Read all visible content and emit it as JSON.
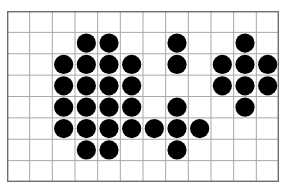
{
  "figure": {
    "kind": "dot-grid-pattern",
    "background_color": "#ffffff",
    "grid": {
      "columns": 12,
      "rows": 8,
      "cell_width": 22.67,
      "cell_height": 21.38,
      "line_color": "#a8a8a8",
      "border_color": "#6e6e6e",
      "line_width": 1,
      "border_width": 1.4,
      "origin_x": 7,
      "origin_y": 11,
      "width": 272,
      "height": 171
    },
    "dot": {
      "color": "#000000",
      "radius": 9.6,
      "count": 33
    },
    "shapes": [
      {
        "name": "left-shape",
        "label": "left-block",
        "cells": [
          [
            3,
            1
          ],
          [
            4,
            1
          ],
          [
            2,
            2
          ],
          [
            3,
            2
          ],
          [
            4,
            2
          ],
          [
            5,
            2
          ],
          [
            2,
            3
          ],
          [
            3,
            3
          ],
          [
            4,
            3
          ],
          [
            5,
            3
          ],
          [
            2,
            4
          ],
          [
            3,
            4
          ],
          [
            4,
            4
          ],
          [
            5,
            4
          ],
          [
            2,
            5
          ],
          [
            3,
            5
          ],
          [
            4,
            5
          ],
          [
            5,
            5
          ],
          [
            3,
            6
          ],
          [
            4,
            6
          ]
        ]
      },
      {
        "name": "middle-shape",
        "label": "middle-plus",
        "cells": [
          [
            7,
            1
          ],
          [
            7,
            2
          ],
          [
            7,
            4
          ],
          [
            6,
            5
          ],
          [
            7,
            5
          ],
          [
            8,
            5
          ],
          [
            7,
            6
          ]
        ]
      },
      {
        "name": "right-shape",
        "label": "right-plus",
        "cells": [
          [
            10,
            1
          ],
          [
            9,
            2
          ],
          [
            10,
            2
          ],
          [
            11,
            2
          ],
          [
            9,
            3
          ],
          [
            10,
            3
          ],
          [
            11,
            3
          ],
          [
            10,
            4
          ]
        ]
      }
    ]
  }
}
